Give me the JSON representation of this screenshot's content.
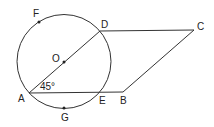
{
  "diagram": {
    "type": "geometry",
    "colors": {
      "stroke": "#333333",
      "background": "#ffffff"
    },
    "circle": {
      "center_label": "O",
      "cx": 64,
      "cy": 61.5,
      "r": 47
    },
    "points": {
      "A": {
        "label": "A",
        "x": 29,
        "y": 93
      },
      "B": {
        "label": "B",
        "x": 123,
        "y": 92
      },
      "C": {
        "label": "C",
        "x": 194,
        "y": 30
      },
      "D": {
        "label": "D",
        "x": 100,
        "y": 31
      },
      "E": {
        "label": "E",
        "x": 101,
        "y": 93
      },
      "F": {
        "label": "F",
        "x": 39,
        "y": 22
      },
      "G": {
        "label": "G",
        "x": 64,
        "y": 108
      },
      "O": {
        "label": "O",
        "x": 64,
        "y": 62
      }
    },
    "angle_annotation": {
      "text": "45°",
      "at": "A"
    }
  }
}
